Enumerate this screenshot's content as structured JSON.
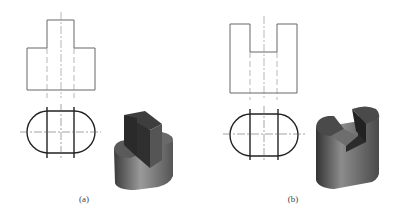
{
  "figure": {
    "panels": [
      {
        "label": "(a)",
        "description": "T-shaped front view over a stadium-shaped top view with an isometric shaded block: rounded base with rectangular boss on top"
      },
      {
        "label": "(b)",
        "description": "U-shaped front view with center slot over a stadium-shaped top view with an isometric shaded rounded block having a slot cut from the top"
      }
    ],
    "colors": {
      "line": "#555555",
      "thick_line": "#222222",
      "centerline": "#888888",
      "solid_dark": "#3a3a3a",
      "solid_mid": "#6a6a6a",
      "solid_light": "#9a9a9a"
    }
  }
}
